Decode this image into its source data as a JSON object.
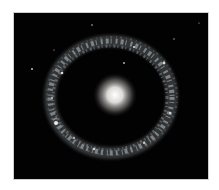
{
  "image": {
    "subject": "ring galaxy",
    "description": "Bright yellowish-white spherical core surrounded by a clumpy bluish-white ring of stars on black space background",
    "colors": {
      "background": "#020202",
      "core": "#ffffff",
      "ring": "#c8ccd0",
      "page": "#ffffff"
    }
  }
}
